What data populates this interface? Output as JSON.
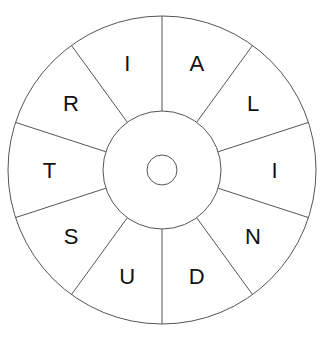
{
  "puzzle": {
    "type": "word-wheel",
    "center_letter": "",
    "segments": [
      {
        "letter": "A"
      },
      {
        "letter": "L"
      },
      {
        "letter": "I"
      },
      {
        "letter": "N"
      },
      {
        "letter": "D"
      },
      {
        "letter": "U"
      },
      {
        "letter": "S"
      },
      {
        "letter": "T"
      },
      {
        "letter": "R"
      },
      {
        "letter": "I"
      }
    ]
  },
  "colors": {
    "line": "#555555",
    "text": "#111111",
    "background": "#ffffff"
  }
}
